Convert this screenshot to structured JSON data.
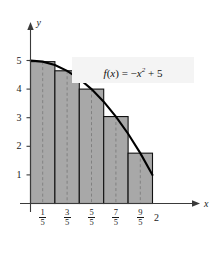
{
  "chart_data": {
    "type": "bar",
    "title": "",
    "subtitle": "",
    "annotation": "f(x) = −x² + 5",
    "function_expression": "f(x) = -x^2 + 5",
    "method": "midpoint Riemann sum",
    "xlabel": "x",
    "ylabel": "y",
    "xlim": [
      0,
      2.35
    ],
    "ylim": [
      0,
      5.6
    ],
    "grid": false,
    "legend": null,
    "x_tick_labels": [
      "1/5",
      "3/5",
      "5/5",
      "7/5",
      "9/5",
      "2"
    ],
    "x_tick_values": [
      0.2,
      0.6,
      1.0,
      1.4,
      1.8,
      2.0
    ],
    "x_tick_fractions": [
      {
        "num": "1",
        "den": "5"
      },
      {
        "num": "3",
        "den": "5"
      },
      {
        "num": "5",
        "den": "5"
      },
      {
        "num": "7",
        "den": "5"
      },
      {
        "num": "9",
        "den": "5"
      }
    ],
    "x_tick_whole": "2",
    "y_tick_labels": [
      "1",
      "2",
      "3",
      "4",
      "5"
    ],
    "y_tick_values": [
      1,
      2,
      3,
      4,
      5
    ],
    "categories": [
      "0 to 0.4",
      "0.4 to 0.8",
      "0.8 to 1.2",
      "1.2 to 1.6",
      "1.6 to 2.0"
    ],
    "midpoints": [
      0.2,
      0.6,
      1.0,
      1.4,
      1.8
    ],
    "values": [
      4.96,
      4.64,
      4.0,
      3.04,
      1.76
    ],
    "bar_edges": [
      0,
      0.4,
      0.8,
      1.2,
      1.6,
      2.0
    ],
    "bar_fill_color": "#a8a8a8",
    "bar_edge_color": "#111111",
    "midline_color": "#777777",
    "curve_color": "#000000",
    "axis_color": "#3a3a3a",
    "annotation_bg_color": "#f4f4f4",
    "curve_points": [
      {
        "x": 0.0,
        "y": 5.0
      },
      {
        "x": 0.2,
        "y": 4.96
      },
      {
        "x": 0.4,
        "y": 4.84
      },
      {
        "x": 0.6,
        "y": 4.64
      },
      {
        "x": 0.8,
        "y": 4.36
      },
      {
        "x": 1.0,
        "y": 4.0
      },
      {
        "x": 1.2,
        "y": 3.56
      },
      {
        "x": 1.4,
        "y": 3.04
      },
      {
        "x": 1.6,
        "y": 2.44
      },
      {
        "x": 1.8,
        "y": 1.76
      },
      {
        "x": 2.0,
        "y": 1.0
      }
    ]
  }
}
